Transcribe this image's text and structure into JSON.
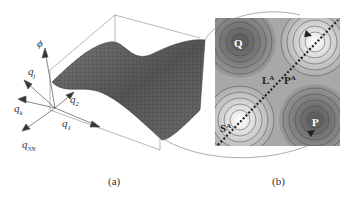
{
  "panel_a": {
    "caption": "(a)",
    "axes": {
      "phi": "ϕ",
      "qj": "q",
      "qj_sub": "j",
      "qk": "q",
      "qk_sub": "k",
      "q3N": "q",
      "q3N_sub": "3N",
      "q1": "q",
      "q1_sub": "1",
      "q2": "q",
      "q2_sub": "2"
    }
  },
  "panel_b": {
    "caption": "(b)",
    "points": {
      "Q": "Q",
      "P": "P",
      "L": "L",
      "L_sup": "A",
      "P3": "P",
      "P3_sup": "A",
      "S": "S",
      "S_sup": "A"
    },
    "colors": {
      "dark_well": "#5a5a5a",
      "light_well": "#f4f4f4",
      "mid": "#a8a8a8"
    }
  }
}
